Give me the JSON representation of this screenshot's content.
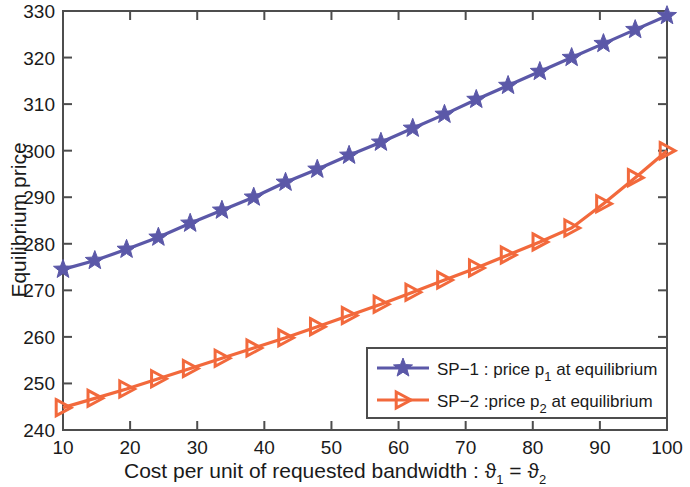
{
  "chart_data": {
    "type": "line",
    "title": "",
    "xlabel": "Cost per unit of requested bandwidth : ϑ₁ = ϑ₂",
    "ylabel": "Equilibrium price",
    "xlim": [
      10,
      100
    ],
    "ylim": [
      240,
      330
    ],
    "xticks": [
      10,
      20,
      30,
      40,
      50,
      60,
      70,
      80,
      90,
      100
    ],
    "yticks": [
      240,
      250,
      260,
      270,
      280,
      290,
      300,
      310,
      320,
      330
    ],
    "grid": false,
    "legend_position": "lower right",
    "x": [
      10,
      14.74,
      19.47,
      24.21,
      28.95,
      33.68,
      38.42,
      43.16,
      47.89,
      52.63,
      57.37,
      62.11,
      66.84,
      71.58,
      76.32,
      81.05,
      85.79,
      90.53,
      95.26,
      100
    ],
    "series": [
      {
        "name": "SP-1 : price p₁ at equilibrium",
        "color": "#5b58a8",
        "marker": "star",
        "values": [
          274.5,
          276.4,
          278.8,
          281.4,
          284.4,
          287.2,
          290.0,
          293.2,
          296.0,
          299.0,
          301.8,
          304.8,
          307.8,
          311.0,
          314.0,
          317.0,
          320.0,
          323.0,
          326.0,
          329.0
        ]
      },
      {
        "name": "SP-2 :price p₂ at equilibrium",
        "color": "#f2693c",
        "marker": "triangle-right",
        "values": [
          244.8,
          246.8,
          248.8,
          251.0,
          253.2,
          255.4,
          257.6,
          259.8,
          262.2,
          264.6,
          267.0,
          269.6,
          272.2,
          274.8,
          277.6,
          280.4,
          283.4,
          288.6,
          294.2,
          300.0
        ]
      }
    ]
  },
  "axes": {
    "ylabel": "Equilibrium price",
    "xlabel_main": "Cost per unit of requested bandwidth : ",
    "xlabel_theta1": "ϑ",
    "xlabel_sub1": "1",
    "xlabel_eq": " = ",
    "xlabel_theta2": "ϑ",
    "xlabel_sub2": "2",
    "xtick_labels": [
      "10",
      "20",
      "30",
      "40",
      "50",
      "60",
      "70",
      "80",
      "90",
      "100"
    ],
    "ytick_labels": [
      "240",
      "250",
      "260",
      "270",
      "280",
      "290",
      "300",
      "310",
      "320",
      "330"
    ],
    "axis_color": "#4d4d4d"
  },
  "legend": {
    "entries": [
      {
        "prefix": "SP−1 : price p",
        "sub": "1",
        "suffix": " at equilibrium",
        "color": "#5b58a8",
        "marker": "star"
      },
      {
        "prefix": "SP−2 :price p",
        "sub": "2",
        "suffix": " at equilibrium",
        "color": "#f2693c",
        "marker": "triangle-right"
      }
    ],
    "border_color": "#4d4d4d",
    "background": "#ffffff"
  }
}
